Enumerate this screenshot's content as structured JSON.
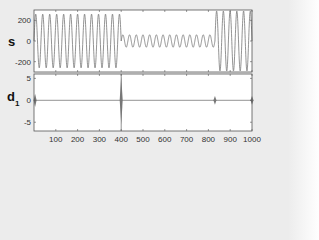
{
  "chart_data": [
    {
      "type": "line",
      "title": "",
      "xlabel": "",
      "ylabel": "s",
      "xlim": [
        0,
        1000
      ],
      "ylim": [
        -300,
        300
      ],
      "yticks": [
        200,
        0,
        -200
      ],
      "ytick_labels": [
        "200",
        "0",
        "-200"
      ],
      "grid": false,
      "series": [
        {
          "name": "s",
          "segments": [
            {
              "x_start": 0,
              "x_end": 400,
              "amplitude": 260,
              "cycles": 12.5
            },
            {
              "x_start": 400,
              "x_end": 830,
              "amplitude": 60,
              "cycles": 14
            },
            {
              "x_start": 830,
              "x_end": 1000,
              "amplitude": 290,
              "cycles": 5.5
            }
          ]
        }
      ]
    },
    {
      "type": "line",
      "title": "",
      "xlabel": "",
      "ylabel": "d1",
      "xlim": [
        0,
        1000
      ],
      "ylim": [
        -7,
        6
      ],
      "yticks": [
        5,
        0,
        -5
      ],
      "ytick_labels": [
        "5",
        "0",
        "-5"
      ],
      "xticks": [
        100,
        200,
        300,
        400,
        500,
        600,
        700,
        800,
        900,
        1000
      ],
      "xtick_labels": [
        "100",
        "200",
        "300",
        "400",
        "500",
        "600",
        "700",
        "800",
        "900",
        "1000"
      ],
      "grid": false,
      "series": [
        {
          "name": "d1",
          "baseline": 0,
          "spikes": [
            {
              "x": 5,
              "magnitude": 1.5
            },
            {
              "x": 400,
              "magnitude": 5.5
            },
            {
              "x": 830,
              "magnitude": 1
            },
            {
              "x": 1000,
              "magnitude": 1
            }
          ]
        }
      ]
    }
  ],
  "labels": {
    "top_ylabel": "s",
    "bottom_ylabel_main": "d",
    "bottom_ylabel_sub": "1"
  },
  "colors": {
    "line": "#777777",
    "frame": "#555555",
    "bg": "#ececec"
  }
}
